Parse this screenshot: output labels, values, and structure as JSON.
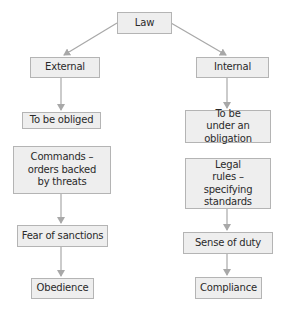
{
  "diagram": {
    "colors": {
      "box_fill": "#eeeeee",
      "box_border": "#b4b4b4",
      "arrow": "#a8a8a8",
      "text": "#2a2a2a"
    },
    "nodes": {
      "law": "Law",
      "external": "External",
      "internal": "Internal",
      "to_be_obliged": "To be obliged",
      "to_be_under_obligation": "To be under an obligation",
      "commands": "Commands – orders backed by threats",
      "legal_rules": "Legal rules – specifying standards",
      "fear_of_sanctions": "Fear of sanctions",
      "sense_of_duty": "Sense of duty",
      "obedience": "Obedience",
      "compliance": "Compliance"
    },
    "edges": [
      [
        "law",
        "external"
      ],
      [
        "law",
        "internal"
      ],
      [
        "external",
        "to_be_obliged"
      ],
      [
        "internal",
        "to_be_under_obligation"
      ],
      [
        "commands",
        "fear_of_sanctions"
      ],
      [
        "legal_rules",
        "sense_of_duty"
      ],
      [
        "fear_of_sanctions",
        "obedience"
      ],
      [
        "sense_of_duty",
        "compliance"
      ]
    ]
  }
}
